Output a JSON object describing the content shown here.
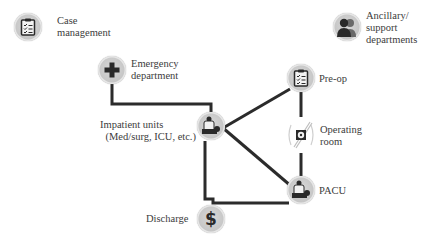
{
  "diagram": {
    "type": "care-flow",
    "colors": {
      "line": "#2b2b2b",
      "icon_bg": "#c8c8c8",
      "icon_glyph": "#2a2a2a",
      "text": "#3c3c3c"
    },
    "nodes": {
      "case_management": {
        "label_1": "Case",
        "label_2": "management",
        "icon": "clipboard-checklist-icon"
      },
      "ancillary": {
        "label_1": "Ancillary/",
        "label_2": "support",
        "label_3": "departments",
        "icon": "people-group-icon"
      },
      "emergency": {
        "label_1": "Emergency",
        "label_2": "department",
        "icon": "medical-cross-icon"
      },
      "inpatient": {
        "label_1": "Impatient units",
        "label_2": "(Med/surg, ICU, etc.)",
        "icon": "patient-bed-icon"
      },
      "preop": {
        "label_1": "Pre-op",
        "icon": "clipboard-checklist-icon"
      },
      "operating_room": {
        "label_1": "Operating",
        "label_2": "room",
        "icon": "radiation-scalpel-icon"
      },
      "pacu": {
        "label_1": "PACU",
        "icon": "patient-bed-icon"
      },
      "discharge": {
        "label_1": "Discharge",
        "icon": "dollar-sign-icon"
      }
    },
    "edges": [
      {
        "from": "Emergency department",
        "to": "Impatient units"
      },
      {
        "from": "Impatient units",
        "to": "Pre-op"
      },
      {
        "from": "Impatient units",
        "to": "PACU"
      },
      {
        "from": "Pre-op",
        "to": "Operating room"
      },
      {
        "from": "Operating room",
        "to": "PACU"
      },
      {
        "from": "Impatient units",
        "to": "Discharge"
      },
      {
        "from": "PACU",
        "to": "Discharge"
      }
    ]
  }
}
